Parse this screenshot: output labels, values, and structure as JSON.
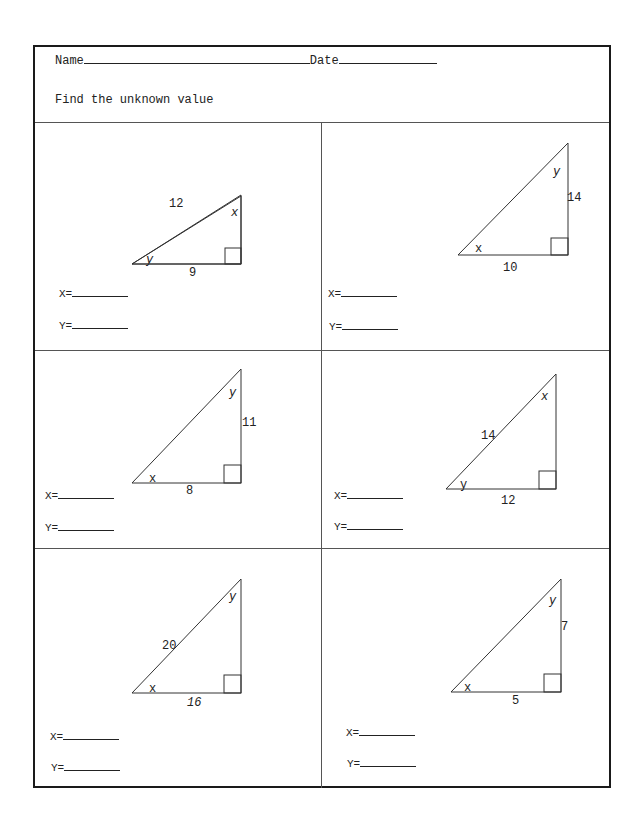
{
  "header": {
    "name_label": "Name",
    "date_label": "Date",
    "instructions": "Find the unknown value"
  },
  "problems": [
    {
      "id": 1,
      "hypotenuse": "12",
      "base": "9",
      "height": "",
      "angle_top": "x",
      "angle_bottom": "y",
      "answer_x_label": "X=",
      "answer_y_label": "Y="
    },
    {
      "id": 2,
      "hypotenuse": "",
      "base": "10",
      "height": "14",
      "angle_top": "y",
      "angle_bottom": "x",
      "answer_x_label": "X=",
      "answer_y_label": "Y="
    },
    {
      "id": 3,
      "hypotenuse": "",
      "base": "8",
      "height": "11",
      "angle_top": "y",
      "angle_bottom": "x",
      "answer_x_label": "X=",
      "answer_y_label": "Y="
    },
    {
      "id": 4,
      "hypotenuse": "14",
      "base": "12",
      "height": "",
      "angle_top": "x",
      "angle_bottom": "y",
      "answer_x_label": "X=",
      "answer_y_label": "Y="
    },
    {
      "id": 5,
      "hypotenuse": "20",
      "base": "16",
      "height": "",
      "angle_top": "y",
      "angle_bottom": "x",
      "answer_x_label": "X=",
      "answer_y_label": "Y="
    },
    {
      "id": 6,
      "hypotenuse": "",
      "base": "5",
      "height": "7",
      "angle_top": "y",
      "angle_bottom": "x",
      "answer_x_label": "X=",
      "answer_y_label": "Y="
    }
  ]
}
